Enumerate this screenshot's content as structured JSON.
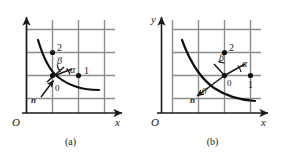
{
  "figure": {
    "background_color": "#ffffff",
    "ink_color": "#1a1a1a",
    "grid_color": "#8c8c8c",
    "curve_color": "#111111",
    "panels": [
      {
        "id": "a",
        "caption": "(a)",
        "origin_label": "O",
        "x_axis_label": "x",
        "y_axis_label": "",
        "grid": {
          "columns": 4,
          "rows": 4
        },
        "points": [
          {
            "name": "node-2",
            "label": "2"
          },
          {
            "name": "node-1",
            "label": "1"
          },
          {
            "name": "node-0",
            "label": "0"
          }
        ],
        "angles": [
          {
            "name": "beta",
            "label": "β"
          },
          {
            "name": "alpha",
            "label": "α"
          }
        ],
        "normal_vector_label": "n",
        "curve_description": "hyperbola-like decreasing curve"
      },
      {
        "id": "b",
        "caption": "(b)",
        "origin_label": "O",
        "x_axis_label": "x",
        "y_axis_label": "y",
        "grid": {
          "columns": 4,
          "rows": 4
        },
        "points": [
          {
            "name": "node-2",
            "label": "2"
          },
          {
            "name": "node-1",
            "label": "1"
          },
          {
            "name": "node-0",
            "label": "0"
          },
          {
            "name": "node-0-prime",
            "label": "0′"
          }
        ],
        "angles": [
          {
            "name": "beta",
            "label": "β"
          },
          {
            "name": "alpha",
            "label": "α"
          }
        ],
        "normal_vector_label": "n",
        "curve_description": "hyperbola-like decreasing curve"
      }
    ]
  }
}
